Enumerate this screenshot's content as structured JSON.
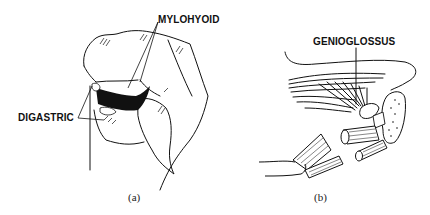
{
  "figure": {
    "panels": [
      {
        "id": "a",
        "caption": "(a)",
        "labels": {
          "mylohyoid": "MYLOHYOID",
          "digastric": "DIGASTRIC"
        }
      },
      {
        "id": "b",
        "caption": "(b)",
        "labels": {
          "genioglossus": "GENIOGLOSSUS"
        }
      }
    ]
  }
}
